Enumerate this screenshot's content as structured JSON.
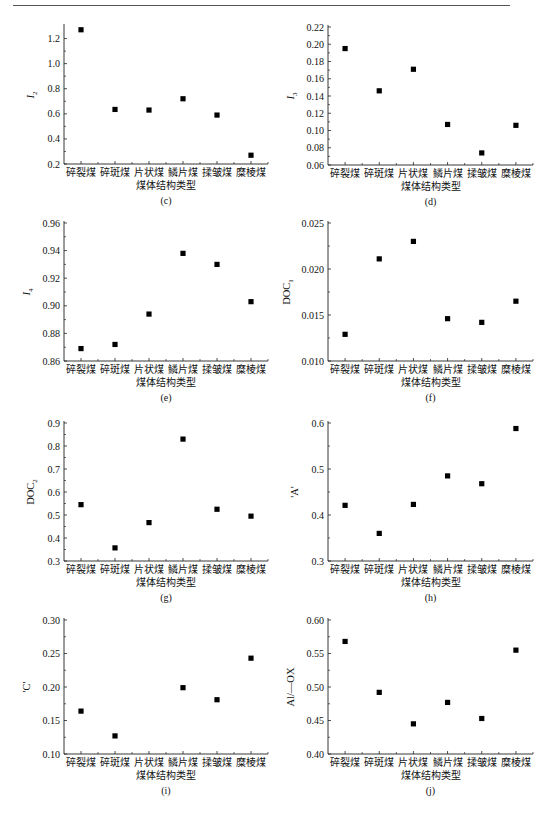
{
  "header": {
    "running_title": "",
    "page_number": ""
  },
  "chart_data": [
    {
      "id": "c",
      "type": "scatter",
      "caption": "(c)",
      "ylabel": "I",
      "ylabel_sub": "2",
      "xlabel": "煤体结构类型",
      "categories": [
        "碎裂煤",
        "碎斑煤",
        "片状煤",
        "鳞片煤",
        "揉皱煤",
        "糜棱煤"
      ],
      "values": [
        1.27,
        0.635,
        0.63,
        0.72,
        0.59,
        0.27
      ],
      "yticks": [
        "0.2",
        "0.4",
        "0.6",
        "0.8",
        "1.0",
        "1.2"
      ],
      "ylim": [
        0.2,
        1.3
      ],
      "yticks_num": [
        0.2,
        0.4,
        0.6,
        0.8,
        1.0,
        1.2
      ],
      "ydec": 1,
      "grid": false,
      "legend": null
    },
    {
      "id": "d",
      "type": "scatter",
      "caption": "(d)",
      "ylabel": "I",
      "ylabel_sub": "3",
      "xlabel": "煤体结构类型",
      "categories": [
        "碎裂煤",
        "碎斑煤",
        "片状煤",
        "鳞片煤",
        "揉皱煤",
        "糜棱煤"
      ],
      "values": [
        0.195,
        0.146,
        0.171,
        0.107,
        0.074,
        0.106
      ],
      "yticks": [
        "0.06",
        "0.08",
        "0.10",
        "0.12",
        "0.14",
        "0.16",
        "0.18",
        "0.20",
        "0.22"
      ],
      "ylim": [
        0.06,
        0.22
      ],
      "yticks_num": [
        0.06,
        0.08,
        0.1,
        0.12,
        0.14,
        0.16,
        0.18,
        0.2,
        0.22
      ],
      "ydec": 2,
      "grid": false,
      "legend": null
    },
    {
      "id": "e",
      "type": "scatter",
      "caption": "(e)",
      "ylabel": "I",
      "ylabel_sub": "4",
      "xlabel": "煤体结构类型",
      "categories": [
        "碎裂煤",
        "碎斑煤",
        "片状煤",
        "鳞片煤",
        "揉皱煤",
        "糜棱煤"
      ],
      "values": [
        0.869,
        0.872,
        0.894,
        0.938,
        0.93,
        0.903
      ],
      "yticks": [
        "0.86",
        "0.88",
        "0.90",
        "0.92",
        "0.94",
        "0.96"
      ],
      "ylim": [
        0.86,
        0.96
      ],
      "yticks_num": [
        0.86,
        0.88,
        0.9,
        0.92,
        0.94,
        0.96
      ],
      "ydec": 2,
      "grid": false,
      "legend": null
    },
    {
      "id": "f",
      "type": "scatter",
      "caption": "(f)",
      "ylabel": "DOC",
      "ylabel_sub": "1",
      "xlabel": "煤体结构类型",
      "categories": [
        "碎裂煤",
        "碎斑煤",
        "片状煤",
        "鳞片煤",
        "揉皱煤",
        "糜棱煤"
      ],
      "values": [
        0.0129,
        0.0211,
        0.023,
        0.0146,
        0.0142,
        0.0165
      ],
      "yticks": [
        "0.010",
        "0.015",
        "0.020",
        "0.025"
      ],
      "ylim": [
        0.01,
        0.025
      ],
      "yticks_num": [
        0.01,
        0.015,
        0.02,
        0.025
      ],
      "ydec": 3,
      "grid": false,
      "legend": null
    },
    {
      "id": "g",
      "type": "scatter",
      "caption": "(g)",
      "ylabel": "DOC",
      "ylabel_sub": "2",
      "xlabel": "煤体结构类型",
      "categories": [
        "碎裂煤",
        "碎斑煤",
        "片状煤",
        "鳞片煤",
        "揉皱煤",
        "糜棱煤"
      ],
      "values": [
        0.545,
        0.357,
        0.467,
        0.83,
        0.525,
        0.495
      ],
      "yticks": [
        "0.3",
        "0.4",
        "0.5",
        "0.6",
        "0.7",
        "0.8",
        "0.9"
      ],
      "ylim": [
        0.3,
        0.9
      ],
      "yticks_num": [
        0.3,
        0.4,
        0.5,
        0.6,
        0.7,
        0.8,
        0.9
      ],
      "ydec": 1,
      "grid": false,
      "legend": null
    },
    {
      "id": "h",
      "type": "scatter",
      "caption": "(h)",
      "ylabel": "'A'",
      "ylabel_sub": "",
      "xlabel": "煤体结构类型",
      "categories": [
        "碎裂煤",
        "碎斑煤",
        "片状煤",
        "鳞片煤",
        "揉皱煤",
        "糜棱煤"
      ],
      "values": [
        0.421,
        0.36,
        0.423,
        0.485,
        0.468,
        0.588
      ],
      "yticks": [
        "0.3",
        "0.4",
        "0.5",
        "0.6"
      ],
      "ylim": [
        0.3,
        0.6
      ],
      "yticks_num": [
        0.3,
        0.4,
        0.5,
        0.6
      ],
      "ydec": 1,
      "grid": false,
      "legend": null
    },
    {
      "id": "i",
      "type": "scatter",
      "caption": "(i)",
      "ylabel": "'C'",
      "ylabel_sub": "",
      "xlabel": "煤体结构类型",
      "categories": [
        "碎裂煤",
        "碎斑煤",
        "片状煤",
        "鳞片煤",
        "揉皱煤",
        "糜棱煤"
      ],
      "values": [
        0.164,
        0.127,
        null,
        0.199,
        0.181,
        0.243
      ],
      "yticks": [
        "0.10",
        "0.15",
        "0.20",
        "0.25",
        "0.30"
      ],
      "ylim": [
        0.1,
        0.3
      ],
      "yticks_num": [
        0.1,
        0.15,
        0.2,
        0.25,
        0.3
      ],
      "ydec": 2,
      "grid": false,
      "legend": null
    },
    {
      "id": "j",
      "type": "scatter",
      "caption": "(j)",
      "ylabel": "Al/—OX",
      "ylabel_sub": "",
      "xlabel": "煤体结构类型",
      "categories": [
        "碎裂煤",
        "碎斑煤",
        "片状煤",
        "鳞片煤",
        "揉皱煤",
        "糜棱煤"
      ],
      "values": [
        0.568,
        0.492,
        0.445,
        0.477,
        0.453,
        0.555
      ],
      "yticks": [
        "0.40",
        "0.45",
        "0.50",
        "0.55",
        "0.60"
      ],
      "ylim": [
        0.4,
        0.6
      ],
      "yticks_num": [
        0.4,
        0.45,
        0.5,
        0.55,
        0.6
      ],
      "ydec": 2,
      "grid": false,
      "legend": null
    }
  ]
}
